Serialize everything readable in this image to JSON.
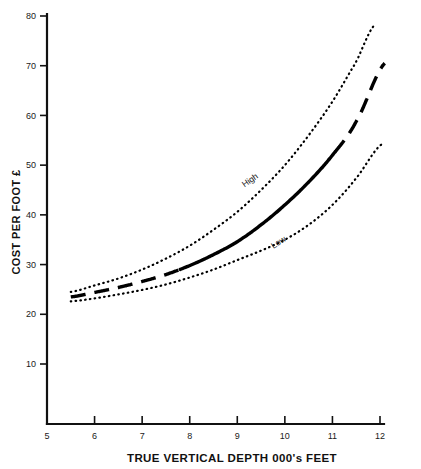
{
  "chart_data": {
    "type": "line",
    "title": "",
    "xlabel": "TRUE VERTICAL DEPTH 000's FEET",
    "ylabel": "COST PER FOOT £",
    "xlim": [
      5,
      12
    ],
    "ylim": [
      0,
      80
    ],
    "xticks": [
      5,
      6,
      7,
      8,
      9,
      10,
      11,
      12
    ],
    "xticklabels": [
      "5",
      "6",
      "7",
      "8",
      "9",
      "10",
      "11",
      "12"
    ],
    "yticks": [
      10,
      20,
      30,
      40,
      50,
      60,
      70,
      80
    ],
    "yticklabels": [
      "10",
      "20",
      "30",
      "40",
      "50",
      "60",
      "70",
      "80"
    ],
    "grid": false,
    "legend_position": "inline-annotations",
    "annotations": [
      {
        "text": "High",
        "x": 9.3,
        "y": 46.5,
        "rotation": -35
      },
      {
        "text": "Low",
        "x": 9.9,
        "y": 34.0,
        "rotation": -33
      }
    ],
    "series": [
      {
        "name": "High",
        "style": "dotted",
        "x": [
          5.5,
          6.0,
          6.5,
          7.0,
          7.5,
          8.0,
          8.5,
          9.0,
          9.5,
          10.0,
          10.5,
          11.0,
          11.5,
          11.9
        ],
        "y": [
          24.5,
          25.8,
          27.2,
          29.0,
          31.2,
          33.8,
          37.0,
          40.6,
          45.0,
          50.0,
          56.0,
          62.8,
          70.8,
          78.4
        ]
      },
      {
        "name": "Mid",
        "style": "dashed-then-solid-then-dashed",
        "solid_from_x": 7.8,
        "solid_to_x": 11.05,
        "x": [
          5.5,
          6.0,
          6.5,
          7.0,
          7.5,
          8.0,
          8.5,
          9.0,
          9.5,
          10.0,
          10.5,
          11.0,
          11.5,
          12.1
        ],
        "y": [
          23.5,
          24.4,
          25.4,
          26.6,
          28.0,
          29.8,
          32.0,
          34.6,
          38.0,
          42.0,
          46.6,
          52.0,
          58.8,
          70.5
        ]
      },
      {
        "name": "Low",
        "style": "dotted",
        "x": [
          5.5,
          6.0,
          6.5,
          7.0,
          7.5,
          8.0,
          8.5,
          9.0,
          9.5,
          10.0,
          10.5,
          11.0,
          11.5,
          12.05
        ],
        "y": [
          22.6,
          23.2,
          24.0,
          24.9,
          26.0,
          27.4,
          29.0,
          30.9,
          32.8,
          35.0,
          38.0,
          42.0,
          47.4,
          54.3
        ]
      }
    ]
  },
  "axes": {
    "x_title": "TRUE VERTICAL DEPTH 000's FEET",
    "y_title": "COST PER FOOT £"
  }
}
